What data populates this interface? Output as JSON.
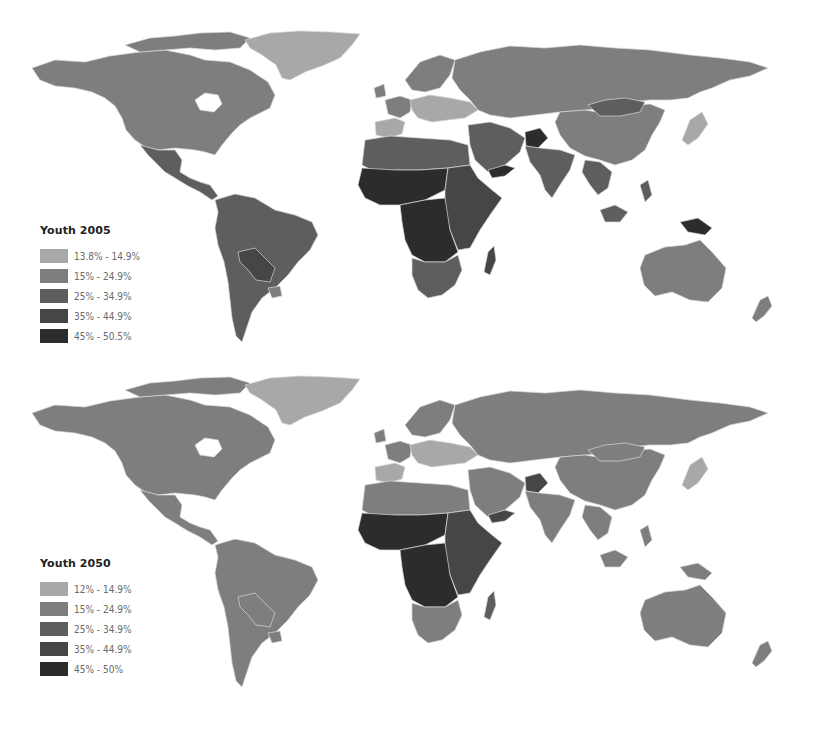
{
  "palette": {
    "c1": "#a8a8a8",
    "c2": "#7e7e7e",
    "c3": "#5e5e5e",
    "c4": "#464646",
    "c5": "#2c2c2c",
    "border": "#d8d8d8",
    "background": "#ffffff"
  },
  "maps": [
    {
      "id": "youth-2005",
      "legend": {
        "title": "Youth 2005",
        "items": [
          {
            "label": "13.8% - 14.9%",
            "color": "#a8a8a8"
          },
          {
            "label": "15% - 24.9%",
            "color": "#7e7e7e"
          },
          {
            "label": "25% - 34.9%",
            "color": "#5e5e5e"
          },
          {
            "label": "35% - 44.9%",
            "color": "#464646"
          },
          {
            "label": "45% - 50.5%",
            "color": "#2c2c2c"
          }
        ]
      },
      "regions": {
        "canada_usa": "#7e7e7e",
        "greenland": "#a8a8a8",
        "mexico_central_america": "#5e5e5e",
        "south_america": "#5e5e5e",
        "bolivia_paraguay": "#464646",
        "uruguay": "#7e7e7e",
        "western_europe": "#7e7e7e",
        "central_europe": "#a8a8a8",
        "iberia": "#a8a8a8",
        "russia": "#7e7e7e",
        "china": "#7e7e7e",
        "mongolia": "#5e5e5e",
        "japan": "#a8a8a8",
        "north_africa": "#5e5e5e",
        "sahel": "#2c2c2c",
        "central_africa": "#2c2c2c",
        "east_africa": "#464646",
        "southern_africa": "#5e5e5e",
        "madagascar": "#464646",
        "middle_east": "#5e5e5e",
        "yemen_afghanistan": "#2c2c2c",
        "south_asia": "#5e5e5e",
        "southeast_asia": "#5e5e5e",
        "new_guinea": "#2c2c2c",
        "australia": "#7e7e7e",
        "new_zealand": "#7e7e7e"
      }
    },
    {
      "id": "youth-2050",
      "legend": {
        "title": "Youth 2050",
        "items": [
          {
            "label": "12% - 14.9%",
            "color": "#a8a8a8"
          },
          {
            "label": "15% - 24.9%",
            "color": "#7e7e7e"
          },
          {
            "label": "25% - 34.9%",
            "color": "#5e5e5e"
          },
          {
            "label": "35% - 44.9%",
            "color": "#464646"
          },
          {
            "label": "45% - 50%",
            "color": "#2c2c2c"
          }
        ]
      },
      "regions": {
        "canada_usa": "#7e7e7e",
        "greenland": "#a8a8a8",
        "mexico_central_america": "#7e7e7e",
        "south_america": "#7e7e7e",
        "bolivia_paraguay": "#7e7e7e",
        "uruguay": "#7e7e7e",
        "western_europe": "#7e7e7e",
        "central_europe": "#a8a8a8",
        "iberia": "#a8a8a8",
        "russia": "#7e7e7e",
        "china": "#7e7e7e",
        "mongolia": "#7e7e7e",
        "japan": "#a8a8a8",
        "north_africa": "#7e7e7e",
        "sahel": "#2c2c2c",
        "central_africa": "#2c2c2c",
        "east_africa": "#464646",
        "southern_africa": "#7e7e7e",
        "madagascar": "#5e5e5e",
        "middle_east": "#7e7e7e",
        "yemen_afghanistan": "#464646",
        "south_asia": "#7e7e7e",
        "southeast_asia": "#7e7e7e",
        "new_guinea": "#7e7e7e",
        "australia": "#7e7e7e",
        "new_zealand": "#7e7e7e"
      }
    }
  ]
}
